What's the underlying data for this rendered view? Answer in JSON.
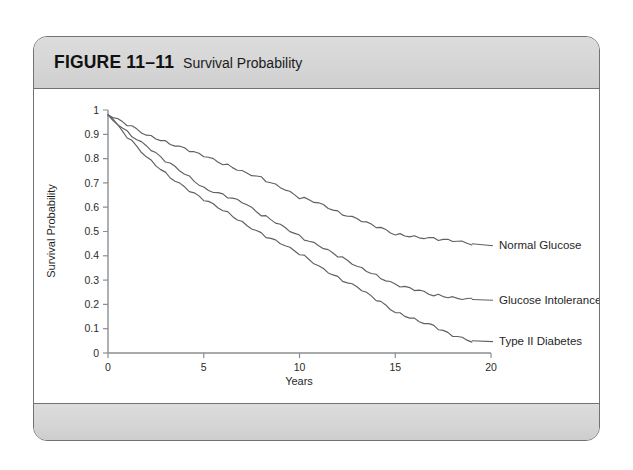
{
  "figure": {
    "number_label": "FIGURE 11–11",
    "caption": "Survival Probability"
  },
  "chart_data": {
    "type": "line",
    "title": "Survival Probability",
    "xlabel": "Years",
    "ylabel": "Survival Probability",
    "xlim": [
      0,
      20
    ],
    "ylim": [
      0,
      1
    ],
    "xticks": [
      0,
      5,
      10,
      15,
      20
    ],
    "xtick_labels": [
      "0",
      "5",
      "10",
      "15",
      "20"
    ],
    "yticks": [
      0,
      0.1,
      0.2,
      0.3,
      0.4,
      0.5,
      0.6,
      0.7,
      0.8,
      0.9,
      1
    ],
    "ytick_labels": [
      "0",
      "0.1",
      "0.2",
      "0.3",
      "0.4",
      "0.5",
      "0.6",
      "0.7",
      "0.8",
      "0.9",
      "1"
    ],
    "grid": false,
    "legend_position": "inline-right-end-labels",
    "series": [
      {
        "name": "Normal Glucose",
        "label": "Normal Glucose",
        "color": "#5d6163",
        "x": [
          0,
          1,
          2,
          3,
          4,
          5,
          6,
          7,
          8,
          9,
          10,
          11,
          12,
          13,
          14,
          15,
          16,
          17,
          18,
          19
        ],
        "y": [
          0.98,
          0.94,
          0.9,
          0.87,
          0.84,
          0.81,
          0.78,
          0.75,
          0.72,
          0.68,
          0.64,
          0.62,
          0.58,
          0.55,
          0.52,
          0.49,
          0.48,
          0.47,
          0.46,
          0.45
        ]
      },
      {
        "name": "Glucose Intolerance",
        "label": "Glucose Intolerance",
        "color": "#5d6163",
        "x": [
          0,
          1,
          2,
          3,
          4,
          5,
          6,
          7,
          8,
          9,
          10,
          11,
          12,
          13,
          14,
          15,
          16,
          17,
          18,
          19
        ],
        "y": [
          0.98,
          0.91,
          0.85,
          0.79,
          0.74,
          0.68,
          0.65,
          0.62,
          0.57,
          0.53,
          0.48,
          0.44,
          0.4,
          0.36,
          0.32,
          0.28,
          0.26,
          0.24,
          0.23,
          0.22
        ]
      },
      {
        "name": "Type II Diabetes",
        "label": "Type II Diabetes",
        "color": "#5d6163",
        "x": [
          0,
          1,
          2,
          3,
          4,
          5,
          6,
          7,
          8,
          9,
          10,
          11,
          12,
          13,
          14,
          15,
          16,
          17,
          18,
          19
        ],
        "y": [
          0.98,
          0.89,
          0.81,
          0.74,
          0.68,
          0.63,
          0.59,
          0.54,
          0.49,
          0.45,
          0.41,
          0.36,
          0.31,
          0.27,
          0.22,
          0.17,
          0.14,
          0.11,
          0.07,
          0.05
        ]
      }
    ]
  }
}
